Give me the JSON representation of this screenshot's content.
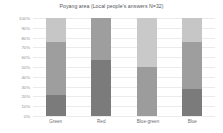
{
  "chart_data": {
    "type": "bar",
    "stacked": true,
    "title": "Poyang area (Local people's answers N=32)",
    "xlabel": "",
    "ylabel": "",
    "ylim": [
      0,
      100
    ],
    "grid": true,
    "legend": "none",
    "categories": [
      "Green",
      "Red",
      "Blue-green",
      "Blue"
    ],
    "tick_labels": [
      "100%",
      "90%",
      "80%",
      "70%",
      "60%",
      "50%",
      "40%",
      "30%",
      "20%",
      "10%",
      "0%"
    ],
    "tick_values": [
      100,
      90,
      80,
      70,
      60,
      50,
      40,
      30,
      20,
      10,
      0
    ],
    "series": [
      {
        "name": "dark",
        "color": "#7b7b7b",
        "values": [
          21,
          57,
          0,
          28
        ]
      },
      {
        "name": "medium",
        "color": "#9e9e9e",
        "values": [
          55,
          43,
          50,
          48
        ]
      },
      {
        "name": "light",
        "color": "#c6c6c6",
        "values": [
          24,
          0,
          50,
          24
        ]
      }
    ],
    "bars": [
      {
        "category": "Green",
        "segments": [
          {
            "series": "light",
            "value": 24,
            "from": 76,
            "to": 100,
            "color": "#c6c6c6"
          },
          {
            "series": "medium",
            "value": 55,
            "from": 21,
            "to": 76,
            "color": "#9e9e9e"
          },
          {
            "series": "dark",
            "value": 21,
            "from": 0,
            "to": 21,
            "color": "#7b7b7b"
          }
        ]
      },
      {
        "category": "Red",
        "segments": [
          {
            "series": "medium",
            "value": 43,
            "from": 57,
            "to": 100,
            "color": "#9e9e9e"
          },
          {
            "series": "dark",
            "value": 57,
            "from": 0,
            "to": 57,
            "color": "#7b7b7b"
          }
        ]
      },
      {
        "category": "Blue-green",
        "segments": [
          {
            "series": "light",
            "value": 50,
            "from": 50,
            "to": 100,
            "color": "#c9c9c9"
          },
          {
            "series": "medium",
            "value": 50,
            "from": 0,
            "to": 50,
            "color": "#9c9c9c"
          }
        ]
      },
      {
        "category": "Blue",
        "segments": [
          {
            "series": "light",
            "value": 24,
            "from": 76,
            "to": 100,
            "color": "#c6c6c6"
          },
          {
            "series": "medium",
            "value": 48,
            "from": 28,
            "to": 76,
            "color": "#9e9e9e"
          },
          {
            "series": "dark",
            "value": 28,
            "from": 0,
            "to": 28,
            "color": "#7b7b7b"
          }
        ]
      }
    ]
  },
  "style": {
    "background": "#ffffff",
    "grid_color": "#ebebeb",
    "title_color": "#55565a",
    "tick_color": "#8d8e92",
    "label_color": "#6e6f73"
  }
}
